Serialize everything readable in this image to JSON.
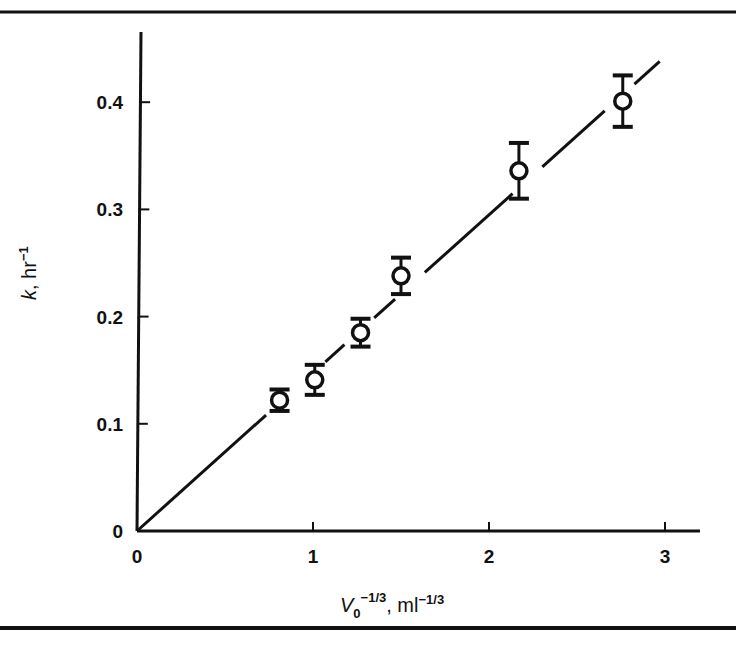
{
  "chart_data": {
    "type": "scatter",
    "title": "",
    "xlabel": "V0^-1/3, ml^-1/3",
    "xlabel_parts": {
      "var": "V",
      "sub": "0",
      "sup": "−1/3",
      "unit": ", ml",
      "unit_sup": "−1/3"
    },
    "ylabel": "k, hr^-1",
    "ylabel_parts": {
      "var": "k",
      "unit": ", hr",
      "unit_sup": "−1"
    },
    "xlim": [
      0,
      3.2
    ],
    "ylim": [
      0,
      0.46
    ],
    "x_ticks": [
      0,
      1,
      2,
      3
    ],
    "x_tick_labels": [
      "0",
      "1",
      "2",
      "3"
    ],
    "y_ticks": [
      0,
      0.1,
      0.2,
      0.3,
      0.4
    ],
    "y_tick_labels": [
      "0",
      "0.1",
      "0.2",
      "0.3",
      "0.4"
    ],
    "grid": false,
    "legend": null,
    "series": [
      {
        "name": "measured k",
        "marker": "open-circle",
        "x": [
          0.81,
          1.01,
          1.27,
          1.5,
          2.17,
          2.76
        ],
        "y": [
          0.122,
          0.141,
          0.185,
          0.238,
          0.336,
          0.401
        ],
        "yerr": [
          0.01,
          0.014,
          0.013,
          0.017,
          0.026,
          0.024
        ]
      }
    ],
    "fit_line": {
      "name": "linear fit through origin",
      "x": [
        0,
        2.97
      ],
      "y": [
        0,
        0.438
      ],
      "style": "solid"
    }
  },
  "colors": {
    "ink": "#111111",
    "background": "#ffffff"
  }
}
